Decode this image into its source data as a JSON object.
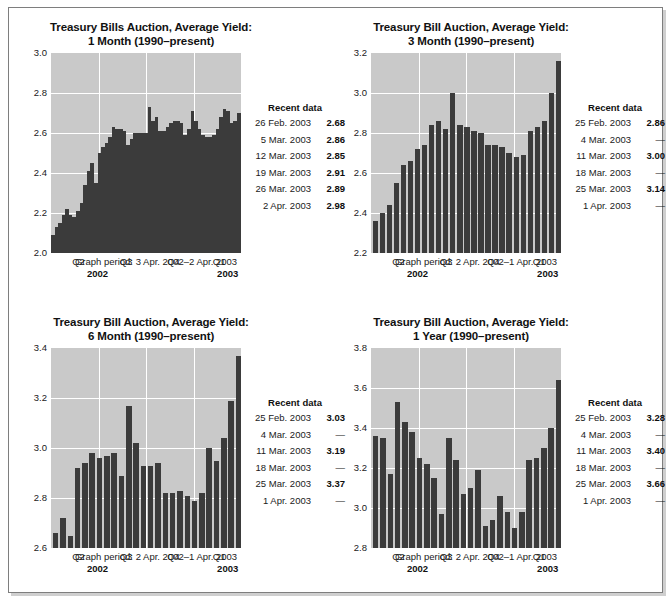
{
  "panels": [
    {
      "id": "one-month",
      "title_line1": "Treasury Bills Auction, Average Yield:",
      "title_line2": "1 Month (1990–present)",
      "period": "Graph period: 3 Apr. 2002–2 Apr. 2003",
      "year_left": "2002",
      "year_right": "2003",
      "quarters": [
        "Q2",
        "Q3",
        "Q4",
        "Q1"
      ],
      "recent_title": "Recent data",
      "recent": [
        {
          "date": "26 Feb. 2003",
          "value": "2.68"
        },
        {
          "date": "5 Mar. 2003",
          "value": "2.86"
        },
        {
          "date": "12 Mar. 2003",
          "value": "2.85"
        },
        {
          "date": "19 Mar. 2003",
          "value": "2.91"
        },
        {
          "date": "26 Mar. 2003",
          "value": "2.89"
        },
        {
          "date": "2 Apr. 2003",
          "value": "2.98"
        }
      ],
      "chart_data": {
        "type": "bar",
        "title": "Treasury Bills Auction, Average Yield: 1 Month (1990–present)",
        "xlabel": "",
        "ylabel": "",
        "ylim": [
          2.0,
          3.0
        ],
        "yticks": [
          2.0,
          2.2,
          2.4,
          2.6,
          2.8,
          3.0
        ],
        "grid": true,
        "legend": "none",
        "x": [
          "2002-04-03",
          "2002-04-10",
          "2002-04-17",
          "2002-04-24",
          "2002-05-01",
          "2002-05-08",
          "2002-05-15",
          "2002-05-22",
          "2002-05-29",
          "2002-06-05",
          "2002-06-12",
          "2002-06-19",
          "2002-06-26",
          "2002-07-03",
          "2002-07-10",
          "2002-07-17",
          "2002-07-24",
          "2002-07-31",
          "2002-08-07",
          "2002-08-14",
          "2002-08-21",
          "2002-08-28",
          "2002-09-04",
          "2002-09-11",
          "2002-09-18",
          "2002-09-25",
          "2002-10-02",
          "2002-10-09",
          "2002-10-16",
          "2002-10-23",
          "2002-10-30",
          "2002-11-06",
          "2002-11-13",
          "2002-11-20",
          "2002-11-27",
          "2002-12-04",
          "2002-12-11",
          "2002-12-18",
          "2002-12-26",
          "2003-01-02",
          "2003-01-08",
          "2003-01-15",
          "2003-01-22",
          "2003-01-29",
          "2003-02-05",
          "2003-02-12",
          "2003-02-19",
          "2003-02-26",
          "2003-03-05",
          "2003-03-12",
          "2003-03-19",
          "2003-03-26",
          "2003-04-02"
        ],
        "values": [
          2.09,
          2.13,
          2.15,
          2.19,
          2.22,
          2.19,
          2.18,
          2.21,
          2.25,
          2.34,
          2.41,
          2.45,
          2.35,
          2.5,
          2.53,
          2.55,
          2.58,
          2.63,
          2.62,
          2.62,
          2.61,
          2.54,
          2.57,
          2.6,
          2.6,
          2.6,
          2.6,
          2.73,
          2.66,
          2.68,
          2.61,
          2.61,
          2.63,
          2.65,
          2.66,
          2.66,
          2.65,
          2.59,
          2.62,
          2.71,
          2.66,
          2.62,
          2.59,
          2.58,
          2.58,
          2.59,
          2.62,
          2.68,
          2.72,
          2.71,
          2.65,
          2.66,
          2.7
        ]
      }
    },
    {
      "id": "three-month",
      "title_line1": "Treasury Bill Auction, Average Yield:",
      "title_line2": "3 Month (1990–present)",
      "period": "Graph period: 2 Apr. 2002–1 Apr. 2003",
      "year_left": "2002",
      "year_right": "2003",
      "quarters": [
        "Q2",
        "Q3",
        "Q4",
        "Q1"
      ],
      "recent_title": "Recent data",
      "recent": [
        {
          "date": "25 Feb. 2003",
          "value": "2.86"
        },
        {
          "date": "4 Mar. 2003",
          "value": "—"
        },
        {
          "date": "11 Mar. 2003",
          "value": "3.00"
        },
        {
          "date": "18 Mar. 2003",
          "value": "—"
        },
        {
          "date": "25 Mar. 2003",
          "value": "3.14"
        },
        {
          "date": "1 Apr. 2003",
          "value": "—"
        }
      ],
      "chart_data": {
        "type": "bar",
        "title": "Treasury Bill Auction, Average Yield: 3 Month (1990–present)",
        "xlabel": "",
        "ylabel": "",
        "ylim": [
          2.2,
          3.2
        ],
        "yticks": [
          2.2,
          2.4,
          2.6,
          2.8,
          3.0,
          3.2
        ],
        "grid": true,
        "legend": "none",
        "values": [
          2.36,
          2.4,
          2.44,
          2.55,
          2.64,
          2.66,
          2.72,
          2.74,
          2.84,
          2.86,
          2.82,
          3.0,
          2.84,
          2.83,
          2.81,
          2.8,
          2.74,
          2.74,
          2.73,
          2.7,
          2.68,
          2.69,
          2.81,
          2.83,
          2.86,
          3.0,
          3.16
        ]
      }
    },
    {
      "id": "six-month",
      "title_line1": "Treasury Bill Auction, Average Yield:",
      "title_line2": "6 Month (1990–present)",
      "period": "Graph period: 2 Apr. 2002–1 Apr. 2003",
      "year_left": "2002",
      "year_right": "2003",
      "quarters": [
        "Q2",
        "Q3",
        "Q4",
        "Q1"
      ],
      "recent_title": "Recent data",
      "recent": [
        {
          "date": "25 Feb. 2003",
          "value": "3.03"
        },
        {
          "date": "4 Mar. 2003",
          "value": "—"
        },
        {
          "date": "11 Mar. 2003",
          "value": "3.19"
        },
        {
          "date": "18 Mar. 2003",
          "value": "—"
        },
        {
          "date": "25 Mar. 2003",
          "value": "3.37"
        },
        {
          "date": "1 Apr. 2003",
          "value": "—"
        }
      ],
      "chart_data": {
        "type": "bar",
        "title": "Treasury Bill Auction, Average Yield: 6 Month (1990–present)",
        "xlabel": "",
        "ylabel": "",
        "ylim": [
          2.6,
          3.4
        ],
        "yticks": [
          2.6,
          2.8,
          3.0,
          3.2,
          3.4
        ],
        "grid": true,
        "legend": "none",
        "values": [
          2.66,
          2.72,
          2.65,
          2.92,
          2.94,
          2.98,
          2.96,
          2.97,
          2.98,
          2.89,
          3.17,
          3.02,
          2.93,
          2.93,
          2.94,
          2.82,
          2.82,
          2.83,
          2.81,
          2.79,
          2.82,
          3.0,
          2.95,
          3.04,
          3.19,
          3.37
        ]
      }
    },
    {
      "id": "one-year",
      "title_line1": "Treasury Bill Auction, Average Yield:",
      "title_line2": "1 Year (1990–present)",
      "period": "Graph period: 2 Apr. 2002–1 Apr. 2003",
      "year_left": "2002",
      "year_right": "2003",
      "quarters": [
        "Q2",
        "Q3",
        "Q4",
        "Q1"
      ],
      "recent_title": "Recent data",
      "recent": [
        {
          "date": "25 Feb. 2003",
          "value": "3.28"
        },
        {
          "date": "4 Mar. 2003",
          "value": "—"
        },
        {
          "date": "11 Mar. 2003",
          "value": "3.40"
        },
        {
          "date": "18 Mar. 2003",
          "value": "—"
        },
        {
          "date": "25 Mar. 2003",
          "value": "3.66"
        },
        {
          "date": "1 Apr. 2003",
          "value": "—"
        }
      ],
      "chart_data": {
        "type": "bar",
        "title": "Treasury Bill Auction, Average Yield: 1 Year (1990–present)",
        "xlabel": "",
        "ylabel": "",
        "ylim": [
          2.8,
          3.8
        ],
        "yticks": [
          2.8,
          3.0,
          3.2,
          3.4,
          3.6,
          3.8
        ],
        "grid": true,
        "legend": "none",
        "values": [
          3.36,
          3.35,
          3.17,
          3.53,
          3.43,
          3.38,
          3.25,
          3.22,
          3.15,
          2.97,
          3.35,
          3.24,
          3.07,
          3.1,
          3.19,
          2.91,
          2.94,
          3.06,
          2.98,
          2.9,
          2.98,
          3.24,
          3.25,
          3.3,
          3.4,
          3.64
        ]
      }
    }
  ]
}
